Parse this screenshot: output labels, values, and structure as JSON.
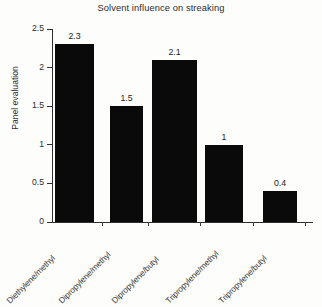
{
  "chart_data": {
    "type": "bar",
    "title": "Solvent influence on streaking",
    "xlabel": "",
    "ylabel": "Panel evaluation",
    "categories": [
      "Diethylene/methyl",
      "Dipropylene/methyl",
      "Dipropylene/butyl",
      "Tripropylene/methyl",
      "Tripropylene/butyl"
    ],
    "values": [
      2.3,
      1.5,
      2.1,
      1,
      0.4
    ],
    "value_labels": [
      "2.3",
      "1.5",
      "2.1",
      "1",
      "0.4"
    ],
    "ylim": [
      0,
      2.5
    ],
    "yticks": [
      0,
      0.5,
      1,
      1.5,
      2,
      2.5
    ],
    "ytick_labels": [
      "0",
      "0.5",
      "1",
      "1.5",
      "2",
      "2.5"
    ],
    "grid": false,
    "legend": "none",
    "bar_color": "#0a0a0a",
    "axis_color": "#2e2e2e",
    "background": "#fdfdfc"
  }
}
